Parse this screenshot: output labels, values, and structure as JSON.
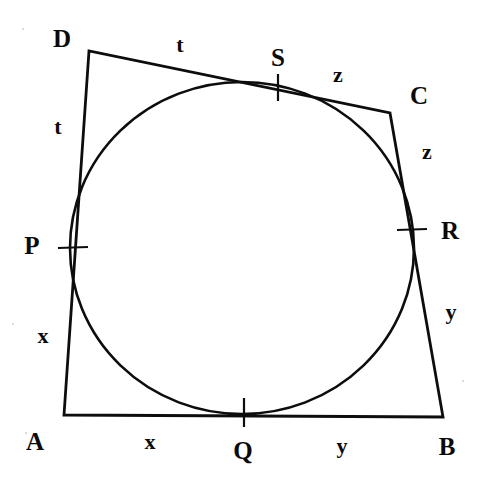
{
  "figure": {
    "stroke_color": "#0d0d0d",
    "background_color": "#ffffff",
    "canvas": {
      "width": 486,
      "height": 494
    },
    "quadrilateral": {
      "name": "ABCD",
      "vertices": [
        {
          "label": "A",
          "x": 64,
          "y": 415
        },
        {
          "label": "B",
          "x": 443,
          "y": 417
        },
        {
          "label": "C",
          "x": 390,
          "y": 113
        },
        {
          "label": "D",
          "x": 89,
          "y": 51
        }
      ],
      "sides": [
        {
          "from": "A",
          "to": "B",
          "segments": [
            "x",
            "y"
          ]
        },
        {
          "from": "B",
          "to": "C",
          "segments": [
            "y",
            "z"
          ]
        },
        {
          "from": "C",
          "to": "D",
          "segments": [
            "z",
            "t"
          ]
        },
        {
          "from": "D",
          "to": "A",
          "segments": [
            "t",
            "x"
          ]
        }
      ]
    },
    "incircle": {
      "center_x": 242,
      "center_y": 248,
      "radius_x": 172,
      "radius_y": 166
    },
    "tangent_points": [
      {
        "label": "P",
        "side": "DA",
        "x": 72,
        "y": 248,
        "tick": "horizontal"
      },
      {
        "label": "Q",
        "side": "AB",
        "x": 244,
        "y": 412,
        "tick": "vertical"
      },
      {
        "label": "R",
        "side": "BC",
        "x": 411,
        "y": 230,
        "tick": "horizontal"
      },
      {
        "label": "S",
        "side": "CD",
        "x": 278,
        "y": 87,
        "tick": "vertical"
      }
    ],
    "vertex_labels": [
      {
        "name": "vertex-label-d",
        "text": "D",
        "x": 62,
        "y": 38
      },
      {
        "name": "vertex-label-c",
        "text": "C",
        "x": 419,
        "y": 95
      },
      {
        "name": "vertex-label-a",
        "text": "A",
        "x": 35,
        "y": 441
      },
      {
        "name": "vertex-label-b",
        "text": "B",
        "x": 447,
        "y": 446
      }
    ],
    "tangent_labels": [
      {
        "name": "tangent-label-p",
        "text": "P",
        "x": 32,
        "y": 245
      },
      {
        "name": "tangent-label-q",
        "text": "Q",
        "x": 243,
        "y": 450
      },
      {
        "name": "tangent-label-r",
        "text": "R",
        "x": 450,
        "y": 230
      },
      {
        "name": "tangent-label-s",
        "text": "S",
        "x": 278,
        "y": 57
      }
    ],
    "segment_labels": [
      {
        "name": "segment-label-t-top",
        "text": "t",
        "x": 180,
        "y": 45
      },
      {
        "name": "segment-label-t-left",
        "text": "t",
        "x": 58,
        "y": 127
      },
      {
        "name": "segment-label-z-top",
        "text": "z",
        "x": 338,
        "y": 75
      },
      {
        "name": "segment-label-z-right",
        "text": "z",
        "x": 427,
        "y": 152
      },
      {
        "name": "segment-label-x-left",
        "text": "x",
        "x": 43,
        "y": 336
      },
      {
        "name": "segment-label-y-right",
        "text": "y",
        "x": 451,
        "y": 312
      },
      {
        "name": "segment-label-x-bottom",
        "text": "x",
        "x": 150,
        "y": 442
      },
      {
        "name": "segment-label-y-bottom",
        "text": "y",
        "x": 342,
        "y": 446
      }
    ]
  }
}
